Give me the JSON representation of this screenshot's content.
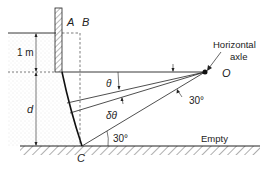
{
  "figure": {
    "labels": {
      "A": "A",
      "B": "B",
      "one_m": "1 m",
      "d": "d",
      "theta": "θ",
      "dtheta": "δθ",
      "angle_upper": "30°",
      "angle_lower": "30°",
      "C": "C",
      "O": "O",
      "axle_line1": "Horizontal",
      "axle_line2": "axle",
      "empty": "Empty"
    },
    "colors": {
      "ink": "#222222",
      "water_dots": "#bbbbbb",
      "background": "#ffffff"
    }
  }
}
